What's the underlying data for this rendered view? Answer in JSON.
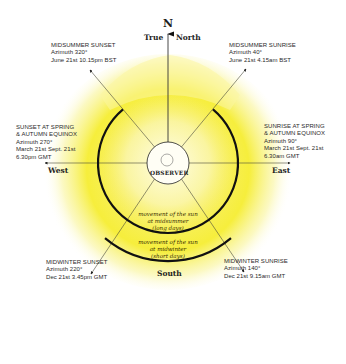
{
  "compass": {
    "north_letter": "N",
    "true_label": "True",
    "north_label": "North",
    "west_label": "West",
    "east_label": "East",
    "south_label": "South"
  },
  "observer_label": "OBSERVER",
  "annotations": {
    "midsummer_sunset": {
      "title": "MIDSUMMER SUNSET",
      "azimuth": "Azimuth 320°",
      "time": "June 21st 10.15pm BST"
    },
    "midsummer_sunrise": {
      "title": "MIDSUMMER SUNRISE",
      "azimuth": "Azimuth 40°",
      "time": "June 21st 4.15am BST"
    },
    "equinox_sunset": {
      "title1": "SUNSET AT SPRING",
      "title2": "& AUTUMN EQUINOX",
      "azimuth": "Azimuth 270°",
      "dates": "March 21st Sept. 21st",
      "time": "6.30pm GMT"
    },
    "equinox_sunrise": {
      "title1": "SUNRISE AT SPRING",
      "title2": "& AUTUMN EQUINOX",
      "azimuth": "Azimuth 90°",
      "dates": "March 21st Sept. 21st",
      "time": "6.30am GMT"
    },
    "midwinter_sunset": {
      "title": "MIDWINTER SUNSET",
      "azimuth": "Azimuth 220°",
      "time": "Dec 21st 3.45pm GMT"
    },
    "midwinter_sunrise": {
      "title": "MIDWINTER SUNRISE",
      "azimuth": "Azimuth 140°",
      "time": "Dec 21st 9.15am GMT"
    }
  },
  "arcs": {
    "midsummer": {
      "line1": "movement of the sun",
      "line2": "at midsummer",
      "line3": "(long days)",
      "from_azimuth": 40,
      "to_azimuth": 320
    },
    "midwinter": {
      "line1": "movement of the sun",
      "line2": "at midwinter",
      "line3": "(short days)",
      "from_azimuth": 140,
      "to_azimuth": 220
    }
  },
  "colors": {
    "sun_glow": "#f7ef2a",
    "arc_stroke": "#111111",
    "line_stroke": "#4a4a3a",
    "text": "#2a2a2a"
  }
}
